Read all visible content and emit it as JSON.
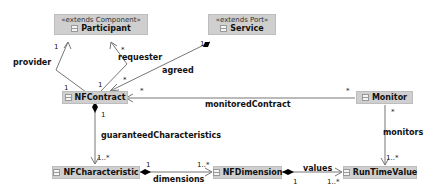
{
  "classes": {
    "participant": {
      "stereotype": "«extends Component»",
      "name": "Participant"
    },
    "service": {
      "stereotype": "«extends Port»",
      "name": "Service"
    },
    "nfcontract": {
      "name": "NFContract"
    },
    "monitor": {
      "name": "Monitor"
    },
    "nfcharacteristic": {
      "name": "NFCharacteristic"
    },
    "nfdimension": {
      "name": "NFDimension"
    },
    "runtimevalue": {
      "name": "RunTimeValue"
    }
  },
  "associations": {
    "provider": {
      "label": "provider",
      "source_mult": "1",
      "target_mult": "1"
    },
    "requester": {
      "label": "requester",
      "source_mult": "1",
      "target_mult": "*"
    },
    "agreed": {
      "label": "agreed",
      "source_mult": "1",
      "target_mult": "*"
    },
    "monitoredContract": {
      "label": "monitoredContract",
      "source_mult": "*",
      "target_mult": "*"
    },
    "guaranteedCharacteristics": {
      "label": "guaranteedCharacteristics",
      "source_mult": "1",
      "target_mult": "1..*"
    },
    "monitors": {
      "label": "monitors",
      "source_mult": "*",
      "target_mult": "1..*"
    },
    "dimensions": {
      "label": "dimensions",
      "source_mult": "1",
      "target_mult": "1..*"
    },
    "values": {
      "label": "values",
      "source_mult": "1",
      "target_mult": "1..*"
    }
  },
  "colors": {
    "class_fill": "#cfcfcf",
    "line": "#777777",
    "diamond": "#000000"
  }
}
